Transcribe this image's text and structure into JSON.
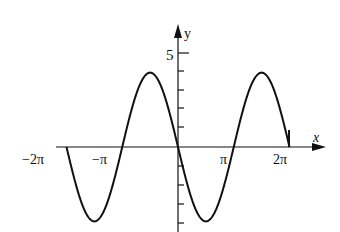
{
  "chart_data": {
    "type": "line",
    "title": "",
    "function": "y = -4 sin(x)",
    "xlabel": "x",
    "ylabel": "y",
    "x_ticks": [
      "-2π",
      "-π",
      "π",
      "2π"
    ],
    "y_ticks": [
      "5"
    ],
    "xlim": [
      "-2π",
      "2π"
    ],
    "ylim": [
      -5,
      5
    ],
    "grid": false,
    "series": [
      {
        "name": "curve",
        "x": [
          "-2π",
          "-3π/2",
          "-π",
          "-π/2",
          "0",
          "π/2",
          "π",
          "3π/2",
          "2π"
        ],
        "values": [
          0,
          -4,
          0,
          4,
          0,
          -4,
          0,
          4,
          0
        ]
      }
    ]
  },
  "labels": {
    "x_axis": "x",
    "y_axis": "y",
    "y5": "5",
    "neg2pi": "−2π",
    "negpi": "−π",
    "pi": "π",
    "twopi": "2π"
  }
}
